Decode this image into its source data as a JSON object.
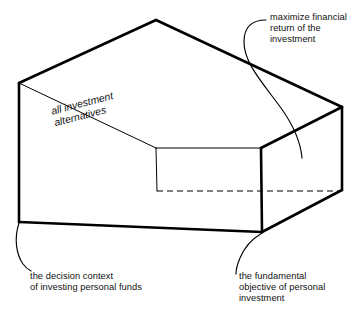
{
  "figure": {
    "type": "3d-box-perspective-diagram",
    "stroke_color": "#000000",
    "background_color": "#ffffff",
    "interior_label": "all investment\nalternatives",
    "annotations": [
      {
        "id": "top-right",
        "text": "maximize financial\nreturn of the\ninvestment",
        "points_at": "top-face-of-box"
      },
      {
        "id": "bottom-left",
        "text": "the decision context\nof investing personal funds",
        "points_at": "front-left-bottom-corner"
      },
      {
        "id": "bottom-right",
        "text": "the fundamental\nobjective of personal\ninvestment",
        "points_at": "front-right-bottom-corner"
      }
    ],
    "box_edges": {
      "solid_thick": [
        "back-top-apex to front-left-top",
        "back-top-apex to right-top-back",
        "front-left-top to front-left-bottom",
        "front-left-bottom to front-right-bottom-near",
        "right-top-back to right-top-front",
        "right-top-front to right-bottom-front",
        "right-bottom-front to front-right-bottom-near"
      ],
      "solid_thin": [
        "front-left-top to mid-inner-corner",
        "mid-inner-corner to right-top-back",
        "front-left-bottom to right-bottom-front",
        "mid-inner-corner vertical to inner-bottom"
      ],
      "dashed": [
        "inner-bottom-corner to right-bottom-back"
      ]
    }
  }
}
